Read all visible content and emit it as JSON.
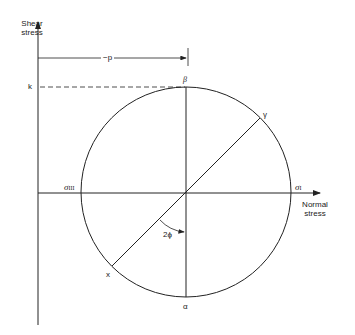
{
  "diagram": {
    "axes": {
      "vertical_label_line1": "Shear",
      "vertical_label_line2": "stress",
      "horizontal_label_line1": "Normal",
      "horizontal_label_line2": "stress"
    },
    "labels": {
      "p": "−p",
      "k": "k",
      "beta": "β",
      "gamma": "γ",
      "sigma_iii": "σ",
      "sigma_iii_sub": "III",
      "sigma_i": "σ",
      "sigma_i_sub": "I",
      "x": "x",
      "alpha": "α",
      "angle": "2ϕ"
    },
    "colors": {
      "stroke": "#222222",
      "background": "#ffffff"
    }
  }
}
